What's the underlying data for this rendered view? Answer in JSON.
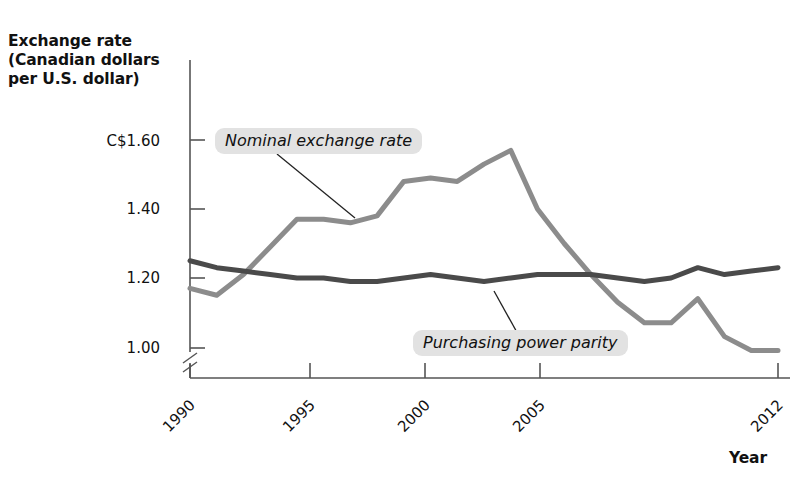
{
  "chart_data": {
    "type": "line",
    "title": "",
    "subtitle": "",
    "ylabel": "Exchange rate\n(Canadian dollars\nper U.S. dollar)",
    "xlabel": "Year",
    "ytick_labels": [
      "C$1.60",
      "1.40",
      "1.20",
      "1.00"
    ],
    "ytick_values": [
      1.6,
      1.4,
      1.2,
      1.0
    ],
    "xtick_labels": [
      "1990",
      "1995",
      "2000",
      "2005",
      "2012"
    ],
    "xtick_values": [
      1990,
      1995,
      2000,
      2005,
      2012
    ],
    "xlim": [
      1990,
      2012
    ],
    "ylim": [
      0.95,
      1.65
    ],
    "grid": false,
    "legend_position": "inline-annotations",
    "axis_break": true,
    "x": [
      1990,
      1991,
      1992,
      1993,
      1994,
      1995,
      1996,
      1997,
      1998,
      1999,
      2000,
      2001,
      2002,
      2003,
      2004,
      2005,
      2006,
      2007,
      2008,
      2009,
      2010,
      2011,
      2012
    ],
    "series": [
      {
        "name": "Nominal exchange rate",
        "color": "#8c8c8c",
        "values": [
          1.17,
          1.15,
          1.21,
          1.29,
          1.37,
          1.37,
          1.36,
          1.38,
          1.48,
          1.49,
          1.48,
          1.53,
          1.57,
          1.4,
          1.3,
          1.21,
          1.13,
          1.07,
          1.07,
          1.14,
          1.03,
          0.99,
          0.99
        ]
      },
      {
        "name": "Purchasing power parity",
        "color": "#4a4a4a",
        "values": [
          1.25,
          1.23,
          1.22,
          1.21,
          1.2,
          1.2,
          1.19,
          1.19,
          1.2,
          1.21,
          1.2,
          1.19,
          1.2,
          1.21,
          1.21,
          1.21,
          1.2,
          1.19,
          1.2,
          1.23,
          1.21,
          1.22,
          1.23
        ]
      }
    ],
    "annotations": [
      {
        "text": "Nominal exchange rate",
        "target_x": 1996,
        "target_y": 1.36
      },
      {
        "text": "Purchasing power parity",
        "target_x": 2001,
        "target_y": 1.19
      }
    ]
  },
  "labels": {
    "y_axis_title": "Exchange rate\n(Canadian dollars\nper U.S. dollar)",
    "x_axis_title": "Year",
    "ytick_0": "C$1.60",
    "ytick_1": "1.40",
    "ytick_2": "1.20",
    "ytick_3": "1.00",
    "xtick_0": "1990",
    "xtick_1": "1995",
    "xtick_2": "2000",
    "xtick_3": "2005",
    "xtick_4": "2012",
    "series_0": "Nominal exchange rate",
    "series_1": "Purchasing power parity"
  }
}
